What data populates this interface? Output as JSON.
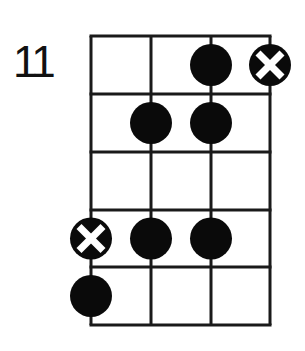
{
  "diagram": {
    "start_fret_label": "11",
    "strings": 4,
    "frets": 5,
    "grid": {
      "x": [
        91,
        151,
        211,
        270
      ],
      "y": [
        36,
        94,
        152,
        210,
        267,
        325
      ]
    },
    "markers": [
      {
        "fret": 1,
        "string": 3,
        "type": "dot"
      },
      {
        "fret": 1,
        "string": 4,
        "type": "x"
      },
      {
        "fret": 2,
        "string": 2,
        "type": "dot"
      },
      {
        "fret": 2,
        "string": 3,
        "type": "dot"
      },
      {
        "fret": 4,
        "string": 1,
        "type": "x"
      },
      {
        "fret": 4,
        "string": 2,
        "type": "dot"
      },
      {
        "fret": 4,
        "string": 3,
        "type": "dot"
      },
      {
        "fret": 5,
        "string": 1,
        "type": "dot"
      }
    ],
    "colors": {
      "line": "#1a1a1a",
      "dot": "#0a0a0a",
      "x_mark": "#ffffff",
      "background": "#ffffff"
    }
  }
}
